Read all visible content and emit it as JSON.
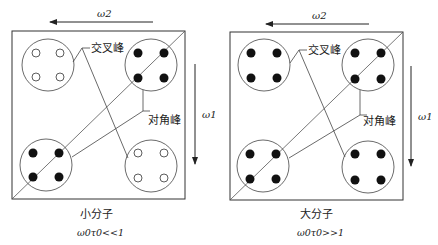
{
  "axes": {
    "horizontal_label": "ω2",
    "vertical_label": "ω1"
  },
  "labels": {
    "cross_peak": "交叉峰",
    "diagonal_peak": "对角峰"
  },
  "panels": [
    {
      "name": "small-molecule",
      "caption": "小分子",
      "condition": "ω0τ0<<1",
      "cross_peaks_filled": false,
      "diagonal_peaks_filled": true
    },
    {
      "name": "large-molecule",
      "caption": "大分子",
      "condition": "ω0τ0>>1",
      "cross_peaks_filled": true,
      "diagonal_peaks_filled": true
    }
  ],
  "colors": {
    "line": "#333333",
    "dot": "#111111"
  }
}
